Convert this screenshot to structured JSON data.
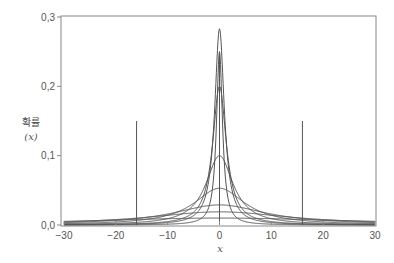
{
  "chart_data": {
    "type": "line",
    "title": "",
    "xlabel": "x",
    "ylabel": "확률 (x)",
    "ylabel_lines": [
      "확률",
      "(x)"
    ],
    "xlim": [
      -30,
      30
    ],
    "ylim": [
      0,
      0.3
    ],
    "x_ticks": [
      -30,
      -20,
      -10,
      0,
      10,
      20,
      30
    ],
    "x_tick_labels": [
      "−30",
      "−20",
      "−10",
      "0",
      "10",
      "20",
      "30"
    ],
    "y_ticks": [
      0.0,
      0.1,
      0.2,
      0.3
    ],
    "y_tick_labels": [
      "0,0",
      "0,1",
      "0,2",
      "0,3"
    ],
    "grid": false,
    "legend": null,
    "series": [
      {
        "name": "curve-1",
        "distribution": "cauchy",
        "center": 0,
        "peak": 0.283
      },
      {
        "name": "curve-2",
        "distribution": "cauchy",
        "center": 0,
        "peak": 0.25,
        "narrow": true
      },
      {
        "name": "curve-3",
        "distribution": "cauchy",
        "center": 0,
        "peak": 0.2
      },
      {
        "name": "curve-4",
        "distribution": "cauchy",
        "center": 0,
        "peak": 0.1
      },
      {
        "name": "curve-5",
        "distribution": "cauchy",
        "center": 0,
        "peak": 0.053
      },
      {
        "name": "curve-6",
        "distribution": "cauchy",
        "center": 0,
        "peak": 0.029
      },
      {
        "name": "curve-7",
        "distribution": "cauchy",
        "center": 0,
        "peak": 0.019
      },
      {
        "name": "curve-8",
        "distribution": "cauchy",
        "center": 0,
        "peak": 0.01
      }
    ],
    "vertical_markers": [
      {
        "x": -16,
        "y_top": 0.15
      },
      {
        "x": 0,
        "y_top": 0.25
      },
      {
        "x": 16,
        "y_top": 0.15
      }
    ]
  },
  "colors": {
    "line": "#555555",
    "axis": "#888888",
    "text": "#555555"
  }
}
